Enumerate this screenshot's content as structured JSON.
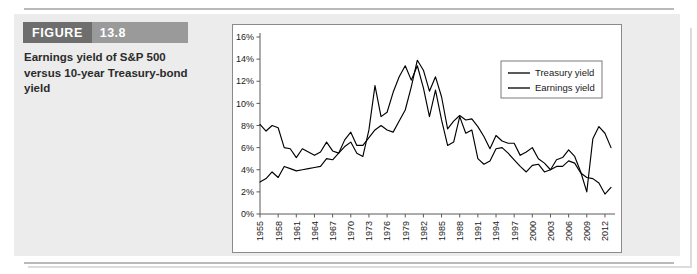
{
  "figure": {
    "tag_word": "FIGURE",
    "tag_number": "13.8",
    "caption": "Earnings yield of S&P 500 versus 10-year Treasury-bond yield"
  },
  "chart_data": {
    "type": "line",
    "title": "",
    "xlabel": "",
    "ylabel": "",
    "xlim": [
      1955,
      2013
    ],
    "ylim": [
      0,
      16
    ],
    "grid": false,
    "legend_position": "top-right",
    "ytick_labels": [
      "0%",
      "2%",
      "4%",
      "6%",
      "8%",
      "10%",
      "12%",
      "14%",
      "16%"
    ],
    "ytick_values": [
      0,
      2,
      4,
      6,
      8,
      10,
      12,
      14,
      16
    ],
    "xtick_labels": [
      "1955",
      "1958",
      "1961",
      "1964",
      "1967",
      "1970",
      "1973",
      "1976",
      "1979",
      "1982",
      "1985",
      "1988",
      "1991",
      "1994",
      "1997",
      "2000",
      "2003",
      "2006",
      "2009",
      "2012"
    ],
    "xtick_values": [
      1955,
      1958,
      1961,
      1964,
      1967,
      1970,
      1973,
      1976,
      1979,
      1982,
      1985,
      1988,
      1991,
      1994,
      1997,
      2000,
      2003,
      2006,
      2009,
      2012
    ],
    "x": [
      1955,
      1956,
      1957,
      1958,
      1959,
      1960,
      1961,
      1962,
      1963,
      1964,
      1965,
      1966,
      1967,
      1968,
      1969,
      1970,
      1971,
      1972,
      1973,
      1974,
      1975,
      1976,
      1977,
      1978,
      1979,
      1980,
      1981,
      1982,
      1983,
      1984,
      1985,
      1986,
      1987,
      1988,
      1989,
      1990,
      1991,
      1992,
      1993,
      1994,
      1995,
      1996,
      1997,
      1998,
      1999,
      2000,
      2001,
      2002,
      2003,
      2004,
      2005,
      2006,
      2007,
      2008,
      2009,
      2010,
      2011,
      2012,
      2013
    ],
    "series": [
      {
        "name": "Treasury yield",
        "color": "#000000",
        "values": [
          2.9,
          3.2,
          3.8,
          3.3,
          4.3,
          4.1,
          3.9,
          4.0,
          4.1,
          4.2,
          4.3,
          5.0,
          4.9,
          5.5,
          6.7,
          7.4,
          6.2,
          6.2,
          6.9,
          7.6,
          8.0,
          7.6,
          7.4,
          8.4,
          9.4,
          11.5,
          13.9,
          13.0,
          11.1,
          12.4,
          10.6,
          7.7,
          8.4,
          8.9,
          8.5,
          8.6,
          7.9,
          7.0,
          5.9,
          7.1,
          6.6,
          6.4,
          6.4,
          5.3,
          5.6,
          6.0,
          5.0,
          4.6,
          4.0,
          4.3,
          4.3,
          4.8,
          4.6,
          3.7,
          3.3,
          3.2,
          2.8,
          1.8,
          2.4
        ]
      },
      {
        "name": "Earnings yield",
        "color": "#000000",
        "values": [
          8.1,
          7.5,
          8.0,
          7.8,
          6.0,
          5.9,
          5.1,
          5.9,
          5.6,
          5.3,
          5.6,
          6.5,
          5.7,
          5.5,
          6.1,
          6.5,
          5.5,
          5.2,
          7.6,
          11.6,
          8.8,
          9.2,
          11.0,
          12.4,
          13.4,
          12.1,
          13.4,
          11.4,
          8.8,
          11.2,
          8.5,
          6.2,
          6.5,
          8.8,
          7.3,
          7.6,
          5.0,
          4.5,
          4.8,
          5.9,
          6.0,
          5.5,
          4.9,
          4.3,
          3.8,
          4.4,
          4.5,
          3.8,
          4.0,
          4.9,
          5.1,
          5.8,
          5.2,
          3.8,
          2.0,
          6.8,
          7.9,
          7.3,
          6.0
        ]
      }
    ]
  }
}
